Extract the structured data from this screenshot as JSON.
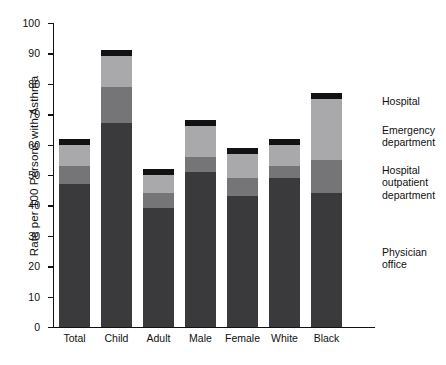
{
  "chart_data": {
    "type": "bar",
    "subtype": "stacked-vertical",
    "title": "",
    "xlabel": "",
    "ylabel": "Rate per 100 Persons with Asthma",
    "ylim": [
      0,
      100
    ],
    "ytick_step": 10,
    "yticks": [
      "0",
      "10",
      "20",
      "30",
      "40",
      "50",
      "60",
      "70",
      "80",
      "90",
      "100"
    ],
    "grid": false,
    "legend_position": "right",
    "categories": [
      "Total",
      "Child",
      "Adult",
      "Male",
      "Female",
      "White",
      "Black"
    ],
    "series": [
      {
        "name": "Physician office",
        "color": "#3a3a3c",
        "values": [
          47,
          67,
          39,
          51,
          43,
          49,
          44
        ]
      },
      {
        "name": "Hospital outpatient department",
        "color": "#757578",
        "values": [
          6,
          12,
          5,
          5,
          6,
          4,
          11
        ]
      },
      {
        "name": "Emergency department",
        "color": "#a9a9ab",
        "values": [
          7,
          10,
          6,
          10,
          8,
          7,
          20
        ]
      },
      {
        "name": "Hospital",
        "color": "#121214",
        "values": [
          2,
          2,
          2,
          2,
          2,
          2,
          2
        ]
      }
    ],
    "totals": [
      63,
      91,
      52,
      68,
      59,
      62,
      77
    ]
  },
  "legend": {
    "items": [
      {
        "label": "Hospital"
      },
      {
        "label": "Emergency\ndepartment"
      },
      {
        "label": "Hospital\noutpatient\ndepartment"
      },
      {
        "label": "Physician\noffice"
      }
    ]
  }
}
